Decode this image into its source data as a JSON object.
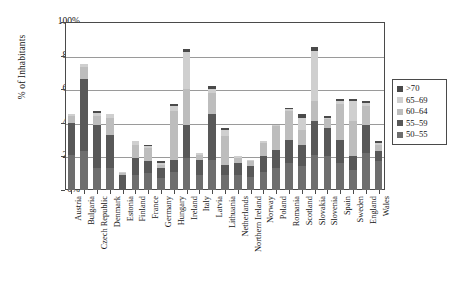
{
  "chart_data": {
    "type": "bar",
    "stacked": true,
    "title": "",
    "xlabel": "",
    "ylabel": "% of Inhabitants",
    "ylim": [
      0,
      100
    ],
    "yticks": [
      0,
      20,
      40,
      60,
      80,
      100
    ],
    "ytick_labels": [
      "0%",
      "20%",
      "40%",
      "60%",
      "80%",
      "100%"
    ],
    "grid": true,
    "legend_position": "right",
    "categories": [
      "Austria",
      "Bulgaria",
      "Czech Republic",
      "Denmark",
      "Estonia",
      "Finland",
      "France",
      "Germany",
      "Hungary",
      "Ireland",
      "Italy",
      "Latvia",
      "Lithuania",
      "Netherlands",
      "Northern Ireland",
      "Norway",
      "Poland",
      "Romania",
      "Scotland",
      "Slovakia",
      "Slovenia",
      "Spain",
      "Sweden",
      "England",
      "Wales"
    ],
    "series": [
      {
        "name": "50-55",
        "color": "#6e6e6e",
        "values": [
          21,
          23,
          13,
          13,
          0,
          9,
          10,
          7,
          11,
          19,
          9,
          18,
          9,
          9,
          8,
          11,
          13,
          16,
          14,
          21,
          20,
          16,
          12,
          22,
          17
        ]
      },
      {
        "name": "55-59",
        "color": "#585858",
        "values": [
          19,
          43,
          26,
          20,
          9,
          10,
          7,
          6,
          7,
          20,
          9,
          27,
          6,
          7,
          6,
          9,
          11,
          14,
          13,
          20,
          17,
          14,
          8,
          17,
          6
        ]
      },
      {
        "name": "60-64",
        "color": "#bdbdbd",
        "values": [
          4,
          7,
          5,
          10,
          1,
          8,
          8,
          2,
          29,
          21,
          3,
          13,
          17,
          3,
          3,
          8,
          14,
          17,
          9,
          12,
          5,
          21,
          21,
          11,
          4
        ]
      },
      {
        "name": "65-69",
        "color": "#cfcfcf",
        "values": [
          1,
          2,
          2,
          2,
          1,
          2,
          1,
          1,
          3,
          22,
          1,
          2,
          4,
          1,
          1,
          1,
          1,
          1,
          7,
          30,
          1,
          2,
          12,
          2,
          1
        ]
      },
      {
        "name": ">70",
        "color": "#4a4a4a",
        "values": [
          0,
          0,
          1,
          0,
          0,
          0,
          1,
          1,
          1,
          2,
          0,
          2,
          1,
          0,
          0,
          0,
          0,
          1,
          2,
          2,
          1,
          1,
          1,
          1,
          1
        ]
      }
    ],
    "totals": [
      45,
      75,
      47,
      45,
      11,
      29,
      27,
      17,
      51,
      84,
      22,
      62,
      37,
      20,
      18,
      29,
      39,
      49,
      45,
      85,
      44,
      54,
      54,
      53,
      29
    ]
  },
  "legend": {
    "items": [
      {
        "label": ">70",
        "color": "#4a4a4a"
      },
      {
        "label": "65–69",
        "color": "#cfcfcf"
      },
      {
        "label": "60–64",
        "color": "#bdbdbd"
      },
      {
        "label": "55–59",
        "color": "#585858"
      },
      {
        "label": "50–55",
        "color": "#6e6e6e"
      }
    ]
  }
}
